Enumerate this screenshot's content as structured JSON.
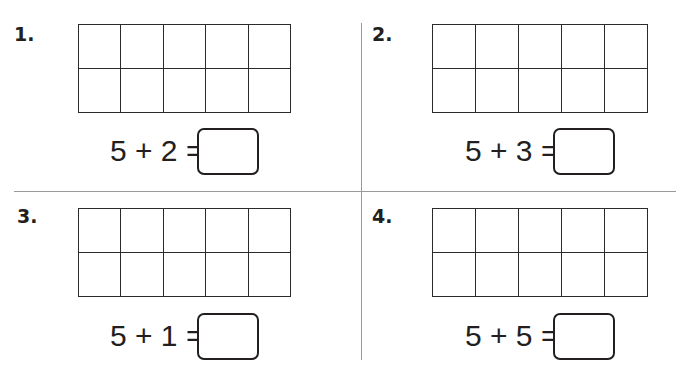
{
  "worksheet": {
    "problems": [
      {
        "number": "1.",
        "equation": "5 + 2 =",
        "answer": "",
        "ten_frame": {
          "rows": 2,
          "cols": 5,
          "filled": 0
        }
      },
      {
        "number": "2.",
        "equation": "5 + 3 =",
        "answer": "",
        "ten_frame": {
          "rows": 2,
          "cols": 5,
          "filled": 0
        }
      },
      {
        "number": "3.",
        "equation": "5 + 1 =",
        "answer": "",
        "ten_frame": {
          "rows": 2,
          "cols": 5,
          "filled": 0
        }
      },
      {
        "number": "4.",
        "equation": "5 + 5 =",
        "answer": "",
        "ten_frame": {
          "rows": 2,
          "cols": 5,
          "filled": 0
        }
      }
    ]
  },
  "colors": {
    "ink": "#231f20",
    "grid_line": "#2b2b2b",
    "divider": "#9a9a9a",
    "background": "#ffffff"
  }
}
